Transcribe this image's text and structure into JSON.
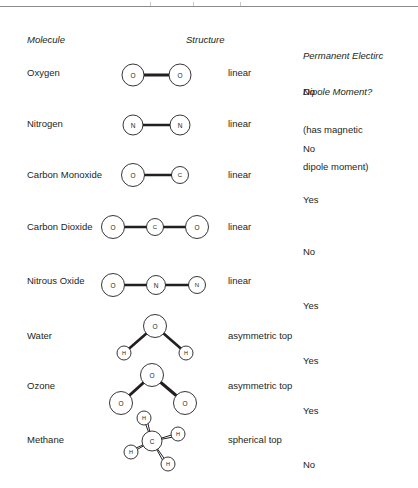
{
  "page": {
    "width": 418,
    "height": 488,
    "background": "#ffffff",
    "ink": "#231f20",
    "rule_color": "#8a8a8a"
  },
  "headers": {
    "molecule": "Molecule",
    "structure": "Structure",
    "dipole_line1": "Permanent Electirc",
    "dipole_line2": "Dipole Moment?"
  },
  "rows": [
    {
      "molecule": "Oxygen",
      "structure": "linear",
      "dipole_line1": "No",
      "dipole_line2": "(has magnetic",
      "dipole_line3": "dipole moment)",
      "diagram": "o2",
      "atoms": [
        "O",
        "O"
      ]
    },
    {
      "molecule": "Nitrogen",
      "structure": "linear",
      "dipole_line1": "No",
      "dipole_line2": "",
      "dipole_line3": "",
      "diagram": "n2",
      "atoms": [
        "N",
        "N"
      ]
    },
    {
      "molecule": "Carbon Monoxide",
      "structure": "linear",
      "dipole_line1": "Yes",
      "dipole_line2": "",
      "dipole_line3": "",
      "diagram": "co",
      "atoms": [
        "O",
        "C"
      ]
    },
    {
      "molecule": "Carbon Dioxide",
      "structure": "linear",
      "dipole_line1": "No",
      "dipole_line2": "",
      "dipole_line3": "",
      "diagram": "co2",
      "atoms": [
        "O",
        "C",
        "O"
      ]
    },
    {
      "molecule": "Nitrous Oxide",
      "structure": "linear",
      "dipole_line1": "Yes",
      "dipole_line2": "",
      "dipole_line3": "",
      "diagram": "n2o",
      "atoms": [
        "O",
        "N",
        "N"
      ]
    },
    {
      "molecule": "Water",
      "structure": "asymmetric top",
      "dipole_line1": "Yes",
      "dipole_line2": "",
      "dipole_line3": "",
      "diagram": "h2o",
      "atoms": [
        "O",
        "H",
        "H"
      ]
    },
    {
      "molecule": "Ozone",
      "structure": "asymmetric top",
      "dipole_line1": "Yes",
      "dipole_line2": "",
      "dipole_line3": "",
      "diagram": "o3",
      "atoms": [
        "O",
        "O",
        "O"
      ]
    },
    {
      "molecule": "Methane",
      "structure": "spherical top",
      "dipole_line1": "No",
      "dipole_line2": "",
      "dipole_line3": "",
      "diagram": "ch4",
      "atoms": [
        "C",
        "H",
        "H",
        "H",
        "H"
      ]
    }
  ]
}
